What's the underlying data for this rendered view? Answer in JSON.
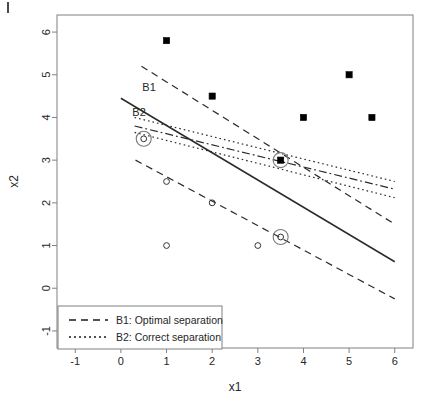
{
  "figure": {
    "axis_titles": {
      "x": "x1",
      "y": "x2"
    },
    "x_ticks": [
      "-1",
      "0",
      "1",
      "2",
      "3",
      "4",
      "5",
      "6"
    ],
    "y_ticks": [
      "-1",
      "0",
      "1",
      "2",
      "3",
      "4",
      "5",
      "6"
    ],
    "annotations": [
      {
        "name": "b1-label",
        "text": "B1"
      },
      {
        "name": "b2-label",
        "text": "B2"
      }
    ],
    "legend": {
      "entries": [
        {
          "label": "B1: Optimal separation",
          "style": "dashed"
        },
        {
          "label": "B2: Correct separation",
          "style": "dotted"
        }
      ]
    }
  },
  "chart_data": {
    "type": "scatter",
    "title": "",
    "xlabel": "x1",
    "ylabel": "x2",
    "xlim": [
      -1.4,
      6.4
    ],
    "ylim": [
      -1.4,
      6.4
    ],
    "xticks": [
      -1,
      0,
      1,
      2,
      3,
      4,
      5,
      6
    ],
    "yticks": [
      -1,
      0,
      1,
      2,
      3,
      4,
      5,
      6
    ],
    "grid": false,
    "legend_position": "bottom-left",
    "series": [
      {
        "name": "Class +1 (filled squares)",
        "marker": "filled-square",
        "color": "#000000",
        "points": [
          {
            "x": 1,
            "y": 5.8
          },
          {
            "x": 2,
            "y": 4.5
          },
          {
            "x": 4,
            "y": 4.0
          },
          {
            "x": 5,
            "y": 5.0
          },
          {
            "x": 5.5,
            "y": 4.0
          },
          {
            "x": 3.5,
            "y": 3.0,
            "circled": true
          }
        ]
      },
      {
        "name": "Class -1 (open circles)",
        "marker": "open-circle",
        "color": "#333333",
        "points": [
          {
            "x": 1,
            "y": 2.5
          },
          {
            "x": 2,
            "y": 2.0
          },
          {
            "x": 1,
            "y": 1.0
          },
          {
            "x": 3,
            "y": 1.0
          },
          {
            "x": 0.5,
            "y": 3.5,
            "circled": true
          },
          {
            "x": 3.5,
            "y": 1.2,
            "circled": true
          }
        ]
      }
    ],
    "lines": [
      {
        "name": "B1 decision boundary",
        "style": "solid",
        "x1": 0.0,
        "y1": 4.45,
        "x2": 6.0,
        "y2": 0.62
      },
      {
        "name": "B1 upper margin",
        "style": "dashed",
        "x1": 0.45,
        "y1": 5.2,
        "x2": 6.0,
        "y2": 1.5
      },
      {
        "name": "B1 lower margin",
        "style": "dashed",
        "x1": 0.32,
        "y1": 3.0,
        "x2": 6.0,
        "y2": -0.25
      },
      {
        "name": "B2 decision boundary",
        "style": "dashdot",
        "x1": 0.3,
        "y1": 3.8,
        "x2": 6.0,
        "y2": 2.32
      },
      {
        "name": "B2 upper margin",
        "style": "dotted",
        "x1": 0.3,
        "y1": 4.0,
        "x2": 6.0,
        "y2": 2.5
      },
      {
        "name": "B2 lower margin",
        "style": "dotted",
        "x1": 0.3,
        "y1": 3.65,
        "x2": 6.0,
        "y2": 2.12
      }
    ],
    "annotations": [
      {
        "text": "B1",
        "x": 0.47,
        "y": 4.72
      },
      {
        "text": "B2",
        "x": 0.25,
        "y": 4.13
      }
    ]
  }
}
